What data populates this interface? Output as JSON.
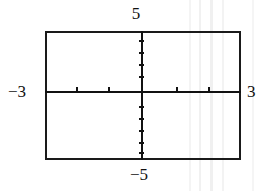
{
  "figure": {
    "kind": "graphing-calculator-viewing-window",
    "background_color": "#ffffff",
    "ink_color": "#111111",
    "labels": {
      "top": "5",
      "bottom": "−5",
      "left": "−3",
      "right": "3"
    }
  },
  "chart_data": {
    "type": "line",
    "title": "",
    "subtitle": "",
    "xlabel": "",
    "ylabel": "",
    "xlim": [
      -3,
      3
    ],
    "ylim": [
      -5,
      5
    ],
    "grid": false,
    "legend": null,
    "axes": {
      "x_axis_drawn": true,
      "y_axis_drawn": true,
      "frame_drawn": true,
      "x_tick_labels": [
        "−3",
        "3"
      ],
      "y_tick_labels": [
        "−5",
        "5"
      ],
      "x_tick_values": [
        -2,
        -1,
        1,
        2
      ],
      "y_tick_values": [
        -4,
        -3,
        -2,
        -1,
        1,
        2,
        3,
        4
      ],
      "x_scale_step": 1,
      "y_scale_step": 1
    },
    "series": [],
    "annotations": [
      {
        "text": "5",
        "position": "top",
        "value": 5
      },
      {
        "text": "−5",
        "position": "bottom",
        "value": -5
      },
      {
        "text": "−3",
        "position": "left",
        "value": -3
      },
      {
        "text": "3",
        "position": "right",
        "value": 3
      }
    ]
  },
  "render": {
    "y_ticks_px": [
      40,
      52,
      64,
      76,
      106,
      118,
      130,
      142,
      152
    ],
    "x_ticks_px": [
      76,
      108,
      176,
      208
    ],
    "streaks_px": [
      {
        "x": 189,
        "w": 2,
        "shade": "#f4f4f4"
      },
      {
        "x": 199,
        "w": 2,
        "shade": "#f1f1f1"
      },
      {
        "x": 210,
        "w": 3,
        "shade": "#f0f0f0"
      },
      {
        "x": 222,
        "w": 2,
        "shade": "#f3f3f3"
      },
      {
        "x": 252,
        "w": 2,
        "shade": "#f5f5f5"
      }
    ]
  }
}
